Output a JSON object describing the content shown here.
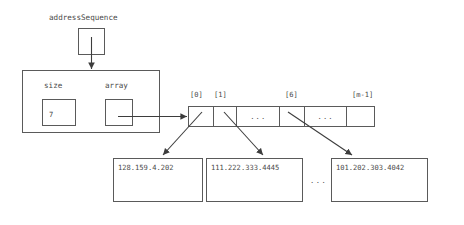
{
  "diagram": {
    "title_var": "addressSequence",
    "struct": {
      "fields": [
        {
          "name": "size",
          "value": "7"
        },
        {
          "name": "array",
          "value": ""
        }
      ]
    },
    "array": {
      "index_labels": [
        "[0]",
        "[1]",
        "[6]",
        "[m-1]"
      ],
      "cells": [
        {
          "id": "c0",
          "text": ""
        },
        {
          "id": "c1",
          "text": ""
        },
        {
          "id": "cgap1",
          "text": "..."
        },
        {
          "id": "c6",
          "text": ""
        },
        {
          "id": "cgap2",
          "text": "..."
        },
        {
          "id": "cm1",
          "text": ""
        }
      ]
    },
    "strings": [
      {
        "id": "s0",
        "value": "128.159.4.202"
      },
      {
        "id": "s1",
        "value": "111.222.333.4445"
      },
      {
        "id": "s2",
        "value": "101.202.303.4042"
      }
    ],
    "ellipsis_between": "...",
    "colors": {
      "stroke": "#5a5a5a",
      "text": "#4a4a4a",
      "background": "#ffffff"
    }
  }
}
